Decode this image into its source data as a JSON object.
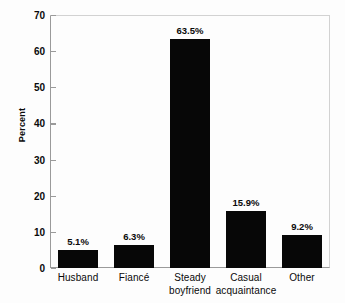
{
  "chart_data": {
    "type": "bar",
    "title": "",
    "xlabel": "",
    "ylabel": "Percent",
    "ylim": [
      0,
      70
    ],
    "ytick_step": 10,
    "yticks": [
      70,
      60,
      50,
      40,
      30,
      20,
      10,
      0
    ],
    "ytick_labels": [
      "70",
      "60",
      "50",
      "40",
      "30",
      "20",
      "10",
      "0"
    ],
    "grid": false,
    "legend": "none",
    "bar_color": "#070707",
    "categories": [
      "Husband",
      "Fiancé",
      "Steady boyfriend",
      "Casual acquaintance",
      "Other"
    ],
    "category_lines": [
      [
        "Husband",
        ""
      ],
      [
        "Fiancé",
        ""
      ],
      [
        "Steady",
        "boyfriend"
      ],
      [
        "Casual",
        "acquaintance"
      ],
      [
        "Other",
        ""
      ]
    ],
    "values": [
      5.1,
      6.3,
      63.5,
      15.9,
      9.2
    ],
    "value_labels": [
      "5.1%",
      "6.3%",
      "63.5%",
      "15.9%",
      "9.2%"
    ]
  }
}
